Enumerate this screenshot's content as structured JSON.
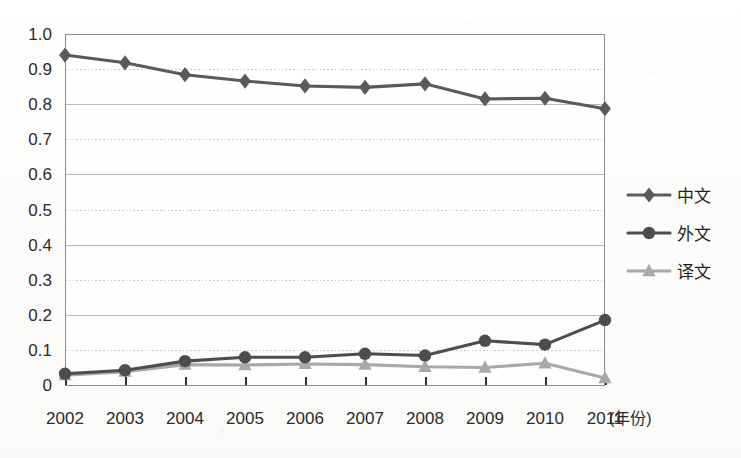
{
  "chart_data": {
    "type": "line",
    "title": "",
    "subtitle": "",
    "xlabel": "(年份)",
    "ylabel": "",
    "x": [
      2002,
      2003,
      2004,
      2005,
      2006,
      2007,
      2008,
      2009,
      2010,
      2011
    ],
    "categories": [
      "2002",
      "2003",
      "2004",
      "2005",
      "2006",
      "2007",
      "2008",
      "2009",
      "2010",
      "2011"
    ],
    "xlim": [
      2002,
      2011
    ],
    "ylim": [
      0,
      1.0
    ],
    "yticks": [
      0,
      0.1,
      0.2,
      0.3,
      0.4,
      0.5,
      0.6,
      0.7,
      0.8,
      0.9,
      1.0
    ],
    "ytick_labels": [
      "0",
      "0.1",
      "0.2",
      "0.3",
      "0.4",
      "0.5",
      "0.6",
      "0.7",
      "0.8",
      "0.9",
      "1.0"
    ],
    "xtick_labels": [
      "2002",
      "2003",
      "2004",
      "2005",
      "2006",
      "2007",
      "2008",
      "2009",
      "2010",
      "2011"
    ],
    "grid": true,
    "grid_axis": "y",
    "legend_position": "right",
    "series": [
      {
        "name": "中文",
        "marker": "diamond",
        "color": "#5a5a5a",
        "values": [
          0.94,
          0.918,
          0.884,
          0.866,
          0.852,
          0.848,
          0.858,
          0.815,
          0.817,
          0.787
        ]
      },
      {
        "name": "外文",
        "marker": "circle",
        "color": "#4d4d4d",
        "values": [
          0.032,
          0.042,
          0.068,
          0.079,
          0.079,
          0.089,
          0.084,
          0.126,
          0.115,
          0.185
        ]
      },
      {
        "name": "译文",
        "marker": "triangle",
        "color": "#a8a8a8",
        "values": [
          0.028,
          0.038,
          0.058,
          0.057,
          0.06,
          0.058,
          0.052,
          0.05,
          0.062,
          0.02
        ]
      }
    ]
  },
  "axes": {
    "y_tick_labels": [
      "1.0",
      "0.9",
      "0.8",
      "0.7",
      "0.6",
      "0.5",
      "0.4",
      "0.3",
      "0.2",
      "0.1",
      "0"
    ],
    "x_tick_labels": [
      "2002",
      "2003",
      "2004",
      "2005",
      "2006",
      "2007",
      "2008",
      "2009",
      "2010",
      "2011"
    ],
    "x_unit_label": "(年份)"
  },
  "legend": {
    "entries": [
      {
        "label": "中文",
        "marker": "diamond-marker-icon",
        "color": "#5a5a5a"
      },
      {
        "label": "外文",
        "marker": "circle-marker-icon",
        "color": "#4d4d4d"
      },
      {
        "label": "译文",
        "marker": "triangle-marker-icon",
        "color": "#a8a8a8"
      }
    ]
  },
  "colors": {
    "background": "#fdfdfc",
    "gridline": "#b8b8b8",
    "gridline_dotted": "#c9c9c9",
    "axis": "#8c8c8c",
    "text": "#2b2b2b",
    "series_zhongwen": "#5a5a5a",
    "series_waiwen": "#4d4d4d",
    "series_yiwen": "#a8a8a8"
  }
}
